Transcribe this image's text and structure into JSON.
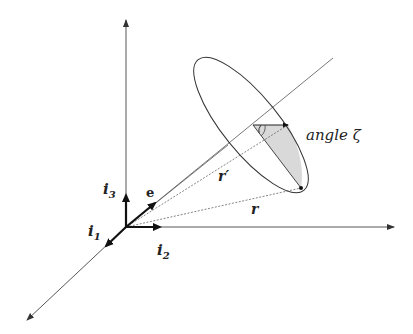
{
  "diagram": {
    "type": "3d-coordinate-frame-cone",
    "labels": {
      "i1": "i",
      "i1_sub": "1",
      "i2": "i",
      "i2_sub": "2",
      "i3": "i",
      "i3_sub": "3",
      "e": "e",
      "r_prime": "r′",
      "r": "r",
      "angle": "angle ζ"
    },
    "colors": {
      "line": "#444444",
      "thick": "#111111",
      "shade": "#d9d9d9"
    }
  }
}
